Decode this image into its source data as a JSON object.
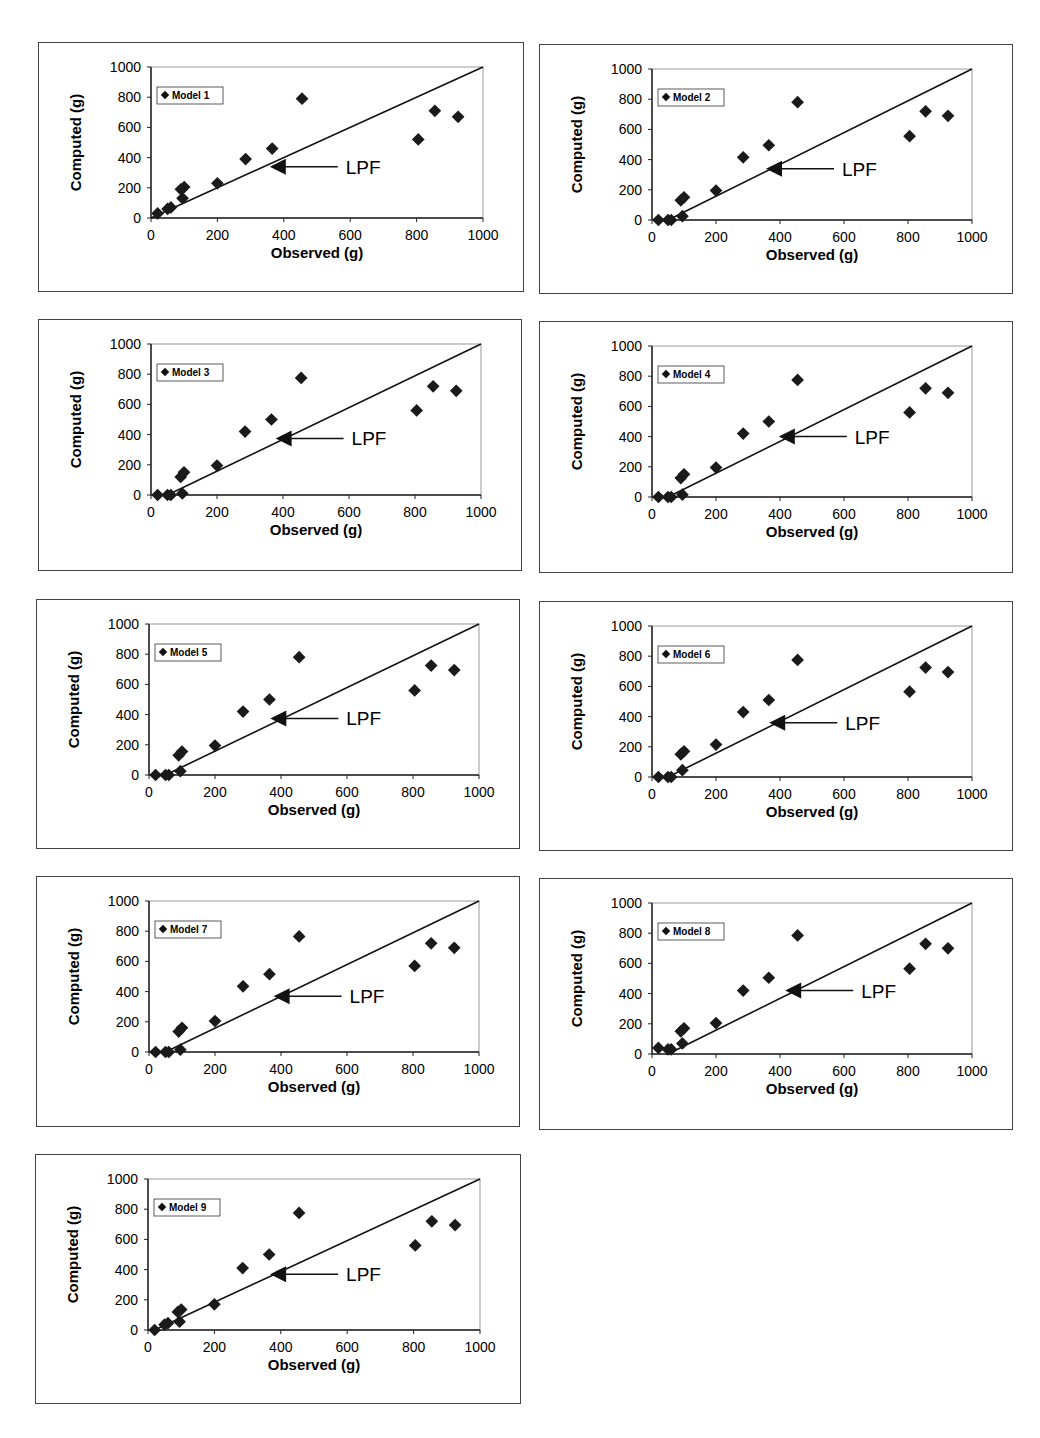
{
  "figure": {
    "x_axis_label": "Observed (g)",
    "y_axis_label": "Computed (g)",
    "annotation": "LPF",
    "ticks": [
      "0",
      "200",
      "400",
      "600",
      "800",
      "1000"
    ]
  },
  "chart_data": [
    {
      "type": "scatter",
      "title": "Model 1",
      "legend": "Model 1",
      "xlabel": "Observed (g)",
      "ylabel": "Computed (g)",
      "xlim": [
        0,
        1000
      ],
      "ylim": [
        0,
        1000
      ],
      "line": {
        "x": [
          0,
          1000
        ],
        "y": [
          0,
          1000
        ]
      },
      "lpf_label": {
        "x": 400,
        "y": 340
      },
      "points": [
        [
          20,
          30
        ],
        [
          50,
          60
        ],
        [
          60,
          70
        ],
        [
          90,
          190
        ],
        [
          95,
          130
        ],
        [
          100,
          205
        ],
        [
          200,
          230
        ],
        [
          285,
          390
        ],
        [
          365,
          460
        ],
        [
          455,
          790
        ],
        [
          805,
          520
        ],
        [
          855,
          710
        ],
        [
          925,
          670
        ]
      ]
    },
    {
      "type": "scatter",
      "title": "Model 2",
      "legend": "Model 2",
      "xlabel": "Observed (g)",
      "ylabel": "Computed (g)",
      "xlim": [
        0,
        1000
      ],
      "ylim": [
        0,
        1000
      ],
      "line": {
        "x": [
          50,
          1000
        ],
        "y": [
          0,
          1000
        ]
      },
      "lpf_label": {
        "x": 400,
        "y": 340
      },
      "points": [
        [
          20,
          0
        ],
        [
          50,
          0
        ],
        [
          60,
          0
        ],
        [
          90,
          130
        ],
        [
          95,
          25
        ],
        [
          100,
          150
        ],
        [
          200,
          195
        ],
        [
          285,
          415
        ],
        [
          365,
          495
        ],
        [
          455,
          780
        ],
        [
          805,
          555
        ],
        [
          855,
          720
        ],
        [
          925,
          690
        ]
      ]
    },
    {
      "type": "scatter",
      "title": "Model 3",
      "legend": "Model 3",
      "xlabel": "Observed (g)",
      "ylabel": "Computed (g)",
      "xlim": [
        0,
        1000
      ],
      "ylim": [
        0,
        1000
      ],
      "line": {
        "x": [
          50,
          1000
        ],
        "y": [
          0,
          1000
        ]
      },
      "lpf_label": {
        "x": 420,
        "y": 375
      },
      "points": [
        [
          20,
          0
        ],
        [
          50,
          0
        ],
        [
          60,
          0
        ],
        [
          90,
          120
        ],
        [
          95,
          10
        ],
        [
          100,
          150
        ],
        [
          200,
          195
        ],
        [
          285,
          420
        ],
        [
          365,
          500
        ],
        [
          455,
          775
        ],
        [
          805,
          560
        ],
        [
          855,
          720
        ],
        [
          925,
          690
        ]
      ]
    },
    {
      "type": "scatter",
      "title": "Model 4",
      "legend": "Model 4",
      "xlabel": "Observed (g)",
      "ylabel": "Computed (g)",
      "xlim": [
        0,
        1000
      ],
      "ylim": [
        0,
        1000
      ],
      "line": {
        "x": [
          50,
          1000
        ],
        "y": [
          0,
          1000
        ]
      },
      "lpf_label": {
        "x": 440,
        "y": 400
      },
      "points": [
        [
          20,
          0
        ],
        [
          50,
          0
        ],
        [
          60,
          0
        ],
        [
          90,
          125
        ],
        [
          95,
          15
        ],
        [
          100,
          150
        ],
        [
          200,
          195
        ],
        [
          285,
          420
        ],
        [
          365,
          500
        ],
        [
          455,
          775
        ],
        [
          805,
          560
        ],
        [
          855,
          720
        ],
        [
          925,
          690
        ]
      ]
    },
    {
      "type": "scatter",
      "title": "Model 5",
      "legend": "Model 5",
      "xlabel": "Observed (g)",
      "ylabel": "Computed (g)",
      "xlim": [
        0,
        1000
      ],
      "ylim": [
        0,
        1000
      ],
      "line": {
        "x": [
          50,
          1000
        ],
        "y": [
          0,
          1000
        ]
      },
      "lpf_label": {
        "x": 410,
        "y": 375
      },
      "points": [
        [
          20,
          0
        ],
        [
          50,
          0
        ],
        [
          60,
          0
        ],
        [
          90,
          130
        ],
        [
          95,
          25
        ],
        [
          100,
          155
        ],
        [
          200,
          195
        ],
        [
          285,
          420
        ],
        [
          365,
          500
        ],
        [
          455,
          780
        ],
        [
          805,
          560
        ],
        [
          855,
          725
        ],
        [
          925,
          695
        ]
      ]
    },
    {
      "type": "scatter",
      "title": "Model 6",
      "legend": "Model 6",
      "xlabel": "Observed (g)",
      "ylabel": "Computed (g)",
      "xlim": [
        0,
        1000
      ],
      "ylim": [
        0,
        1000
      ],
      "line": {
        "x": [
          50,
          1000
        ],
        "y": [
          0,
          1000
        ]
      },
      "lpf_label": {
        "x": 410,
        "y": 360
      },
      "points": [
        [
          20,
          0
        ],
        [
          50,
          0
        ],
        [
          60,
          0
        ],
        [
          90,
          150
        ],
        [
          95,
          45
        ],
        [
          100,
          170
        ],
        [
          200,
          215
        ],
        [
          285,
          430
        ],
        [
          365,
          510
        ],
        [
          455,
          775
        ],
        [
          805,
          565
        ],
        [
          855,
          725
        ],
        [
          925,
          695
        ]
      ]
    },
    {
      "type": "scatter",
      "title": "Model 7",
      "legend": "Model 7",
      "xlabel": "Observed (g)",
      "ylabel": "Computed (g)",
      "xlim": [
        0,
        1000
      ],
      "ylim": [
        0,
        1000
      ],
      "line": {
        "x": [
          50,
          1000
        ],
        "y": [
          0,
          1000
        ]
      },
      "lpf_label": {
        "x": 420,
        "y": 370
      },
      "points": [
        [
          20,
          0
        ],
        [
          50,
          0
        ],
        [
          60,
          0
        ],
        [
          90,
          135
        ],
        [
          95,
          15
        ],
        [
          100,
          160
        ],
        [
          200,
          205
        ],
        [
          285,
          435
        ],
        [
          365,
          515
        ],
        [
          455,
          765
        ],
        [
          805,
          570
        ],
        [
          855,
          720
        ],
        [
          925,
          690
        ]
      ]
    },
    {
      "type": "scatter",
      "title": "Model 8",
      "legend": "Model 8",
      "xlabel": "Observed (g)",
      "ylabel": "Computed (g)",
      "xlim": [
        0,
        1000
      ],
      "ylim": [
        0,
        1000
      ],
      "line": {
        "x": [
          50,
          1000
        ],
        "y": [
          0,
          1000
        ]
      },
      "lpf_label": {
        "x": 460,
        "y": 420
      },
      "points": [
        [
          20,
          40
        ],
        [
          50,
          30
        ],
        [
          60,
          30
        ],
        [
          90,
          150
        ],
        [
          95,
          70
        ],
        [
          100,
          170
        ],
        [
          200,
          205
        ],
        [
          285,
          420
        ],
        [
          365,
          505
        ],
        [
          455,
          785
        ],
        [
          805,
          565
        ],
        [
          855,
          730
        ],
        [
          925,
          700
        ]
      ]
    },
    {
      "type": "scatter",
      "title": "Model 9",
      "legend": "Model 9",
      "xlabel": "Observed (g)",
      "ylabel": "Computed (g)",
      "xlim": [
        0,
        1000
      ],
      "ylim": [
        0,
        1000
      ],
      "line": {
        "x": [
          20,
          1000
        ],
        "y": [
          0,
          1000
        ]
      },
      "lpf_label": {
        "x": 410,
        "y": 370
      },
      "points": [
        [
          20,
          0
        ],
        [
          50,
          35
        ],
        [
          60,
          45
        ],
        [
          90,
          120
        ],
        [
          95,
          55
        ],
        [
          100,
          135
        ],
        [
          200,
          170
        ],
        [
          285,
          410
        ],
        [
          365,
          500
        ],
        [
          455,
          775
        ],
        [
          805,
          560
        ],
        [
          855,
          720
        ],
        [
          925,
          695
        ]
      ]
    }
  ]
}
